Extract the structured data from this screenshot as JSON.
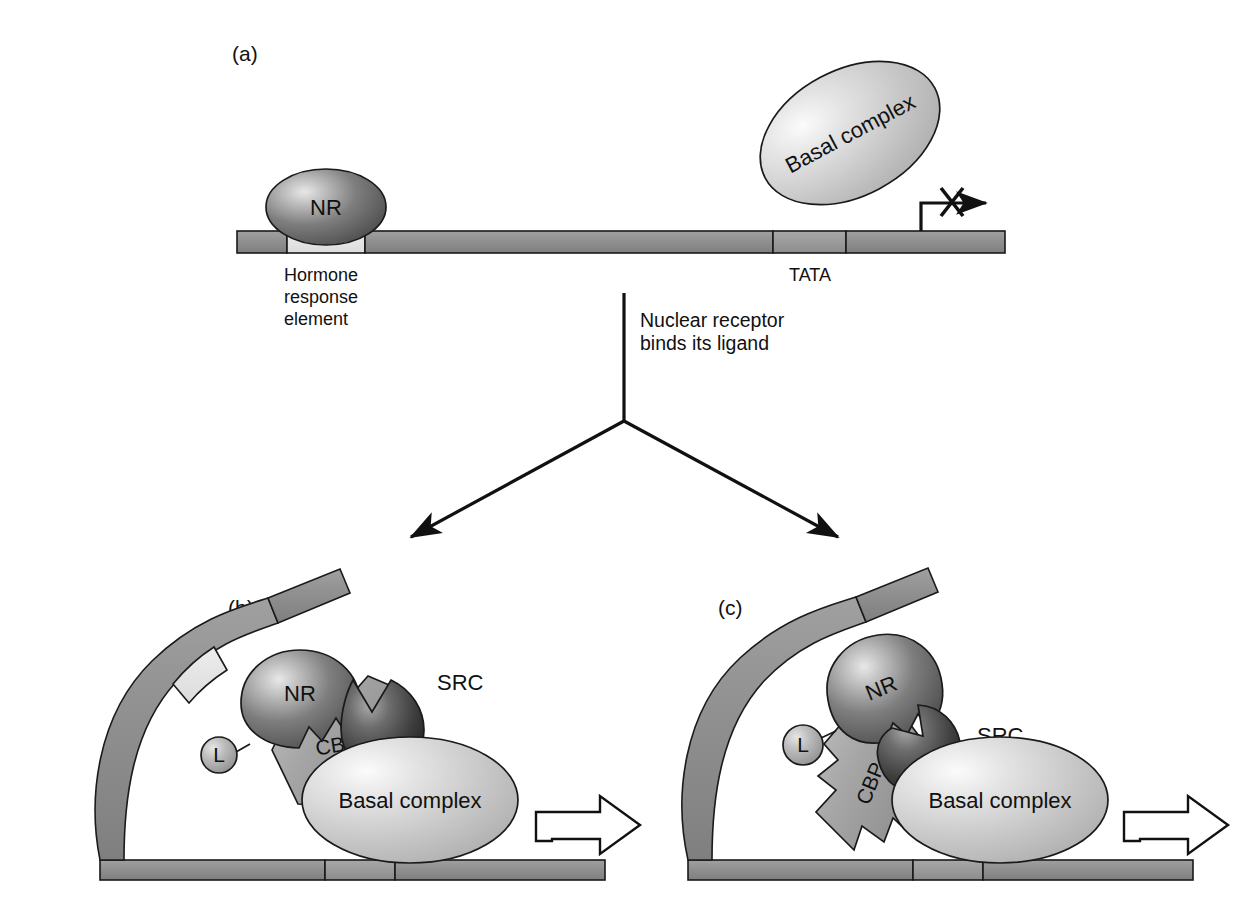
{
  "figure": {
    "background_color": "#ffffff"
  },
  "colors": {
    "dna_backbone": "#8c8c8c",
    "dna_backbone_dark": "#7d7d7d",
    "hormone_response_element": "#e2e2e2",
    "tata_box": "#9a9a9a",
    "nr_dark": "#5f5f5f",
    "nr_light": "#d9d9d9",
    "basal_complex_fill": "#c9c9c9",
    "basal_complex_light": "#f0f0f0",
    "src_dark": "#3a3a3a",
    "cbp_fill": "#a8a8a8",
    "ligand_fill": "#b5b5b5",
    "outline": "#1a1a1a",
    "text": "#111111"
  },
  "panels": [
    {
      "id": "a",
      "label": "(a)",
      "description": "Unliganded nuclear receptor bound to hormone response element; basal complex not engaged; transcription blocked",
      "dna": {
        "segments": [
          {
            "name": "upstream",
            "shade": "dark"
          },
          {
            "name": "hormone-response-element",
            "shade": "light"
          },
          {
            "name": "spacer",
            "shade": "dark"
          },
          {
            "name": "tata-box",
            "shade": "mid"
          },
          {
            "name": "downstream",
            "shade": "dark"
          }
        ]
      },
      "shapes": [
        {
          "name": "nuclear-receptor",
          "label": "NR",
          "type": "ellipse"
        },
        {
          "name": "basal-complex",
          "label": "Basal complex",
          "type": "ellipse-tilted"
        }
      ],
      "labels": [
        {
          "name": "hormone-response-element-label",
          "lines": [
            "Hormone",
            "response",
            "element"
          ]
        },
        {
          "name": "tata-label",
          "text": "TATA"
        }
      ],
      "transcription": {
        "name": "transcription-blocked-arrow",
        "state": "blocked",
        "marker": "X"
      }
    },
    {
      "id": "b",
      "label": "(b)",
      "description": "Ligand bound NR recruits CBP and SRC, looping DNA to contact basal complex; transcription active",
      "shapes": [
        {
          "name": "nuclear-receptor",
          "label": "NR"
        },
        {
          "name": "ligand",
          "label": "L"
        },
        {
          "name": "src-coactivator",
          "label": "SRC"
        },
        {
          "name": "cbp-coactivator",
          "label": "CBP"
        },
        {
          "name": "basal-complex",
          "label": "Basal complex"
        }
      ],
      "transcription": {
        "name": "transcription-active-arrow",
        "state": "active"
      }
    },
    {
      "id": "c",
      "label": "(c)",
      "description": "Alternative arrangement: SRC bridges NR and CBP, CBP contacts basal complex; transcription active",
      "shapes": [
        {
          "name": "nuclear-receptor",
          "label": "NR"
        },
        {
          "name": "ligand",
          "label": "L"
        },
        {
          "name": "src-coactivator",
          "label": "SRC"
        },
        {
          "name": "cbp-coactivator",
          "label": "CBP"
        },
        {
          "name": "basal-complex",
          "label": "Basal complex"
        }
      ],
      "transcription": {
        "name": "transcription-active-arrow",
        "state": "active"
      }
    }
  ],
  "flow": {
    "name": "branching-flow",
    "annotation_lines": [
      "Nuclear receptor",
      "binds its ligand"
    ],
    "annotation_line1": "Nuclear receptor",
    "annotation_line2": "binds its ligand",
    "branches": 2
  },
  "panel_a": {
    "label": "(a)",
    "nr_label": "NR",
    "basal_complex_label": "Basal complex",
    "hre_line1": "Hormone",
    "hre_line2": "response",
    "hre_line3": "element",
    "tata_label": "TATA"
  },
  "panel_b": {
    "label": "(b)",
    "nr_label": "NR",
    "ligand_label": "L",
    "src_label": "SRC",
    "cbp_label": "CBP",
    "basal_complex_label": "Basal complex"
  },
  "panel_c": {
    "label": "(c)",
    "nr_label": "NR",
    "ligand_label": "L",
    "src_label": "SRC",
    "cbp_label": "CBP",
    "basal_complex_label": "Basal complex"
  },
  "caption": {
    "cut_off_text": ""
  }
}
